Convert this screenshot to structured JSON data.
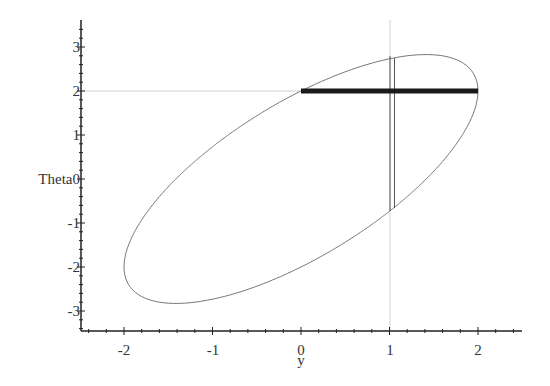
{
  "chart_data": {
    "type": "line",
    "title": "",
    "xlabel": "y",
    "ylabel": "Theta",
    "xlim": [
      -2.5,
      2.5
    ],
    "ylim": [
      -3.5,
      3.5
    ],
    "grid": false,
    "x_ticks": [
      "-2",
      "-1",
      "0",
      "1",
      "2"
    ],
    "y_ticks": [
      "3",
      "2",
      "1",
      "0",
      "-1",
      "-2",
      "-3"
    ],
    "series": [
      {
        "name": "ellipse",
        "kind": "curve",
        "equation": "2*y^2 - 2*y*Theta + Theta^2 = 4",
        "color": "#777777",
        "width": 1
      },
      {
        "name": "horizontal-segment",
        "kind": "segment",
        "points": [
          [
            0,
            2
          ],
          [
            2,
            2
          ]
        ],
        "color": "#1a1a1a",
        "width": 5
      },
      {
        "name": "vertical-segment-left",
        "kind": "segment",
        "points": [
          [
            1.0,
            2.8
          ],
          [
            1.0,
            -0.72
          ]
        ],
        "color": "#555555",
        "width": 1
      },
      {
        "name": "vertical-segment-right",
        "kind": "segment",
        "points": [
          [
            1.05,
            2.75
          ],
          [
            1.05,
            -0.67
          ]
        ],
        "color": "#555555",
        "width": 1
      },
      {
        "name": "guide-horizontal",
        "kind": "reference-line",
        "points": [
          [
            -2.5,
            2
          ],
          [
            0,
            2
          ]
        ],
        "color": "#cccccc",
        "width": 1
      },
      {
        "name": "guide-vertical",
        "kind": "reference-line",
        "points": [
          [
            1,
            3.5
          ],
          [
            1,
            -3.5
          ]
        ],
        "color": "#cccccc",
        "width": 1
      }
    ]
  },
  "axes": {
    "x_label": "y",
    "y_label": "Theta",
    "x_tick_labels": [
      "-2",
      "-1",
      "0",
      "1",
      "2"
    ],
    "y_tick_labels": [
      "3",
      "2",
      "1",
      "",
      "-1",
      "-2",
      "-3"
    ],
    "y_zero_label": "0"
  }
}
